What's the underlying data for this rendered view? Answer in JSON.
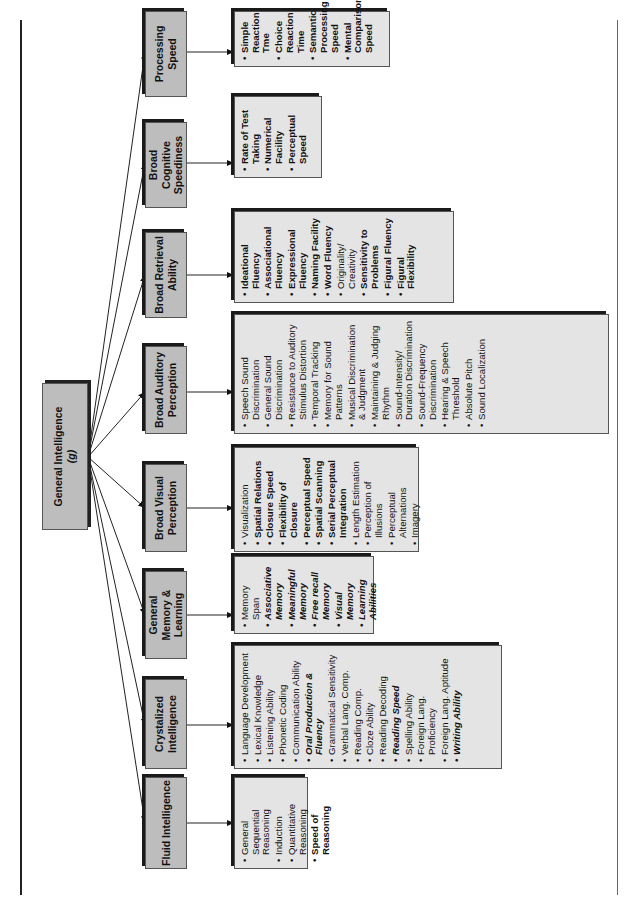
{
  "diagram": {
    "orientation": "rotated 90 degrees counter-clockwise",
    "root": {
      "label_line1": "General Intelligence",
      "label_line2": "(g)"
    },
    "categories": [
      {
        "label": "Fluid Intelligence",
        "abilities": [
          {
            "text": "General Sequential Reasoning",
            "style": "normal"
          },
          {
            "text": "Induction",
            "style": "normal"
          },
          {
            "text": "Quantitative Reasoning",
            "style": "normal"
          },
          {
            "text": "Speed of Reasoning",
            "style": "bold"
          }
        ]
      },
      {
        "label": "Crystalized Intelligence",
        "abilities": [
          {
            "text": "Language Development",
            "style": "normal"
          },
          {
            "text": "Lexical Knowledge",
            "style": "normal"
          },
          {
            "text": "Listening Ability",
            "style": "normal"
          },
          {
            "text": "Phonetic Coding",
            "style": "normal"
          },
          {
            "text": "Communication Ability",
            "style": "normal"
          },
          {
            "text": "Oral Production & Fluency",
            "style": "italic"
          },
          {
            "text": "Grammatical Sensitivity",
            "style": "normal"
          },
          {
            "text": "Verbal Lang. Comp.",
            "style": "normal"
          },
          {
            "text": "Reading Comp.",
            "style": "normal"
          },
          {
            "text": "Cloze Ability",
            "style": "normal"
          },
          {
            "text": "Reading Decoding",
            "style": "normal"
          },
          {
            "text": "Reading Speed",
            "style": "italic"
          },
          {
            "text": "Spelling Ability",
            "style": "normal"
          },
          {
            "text": "Foreign Lang. Proficiency",
            "style": "normal"
          },
          {
            "text": "Foreign Lang. Aptitude",
            "style": "normal"
          },
          {
            "text": "Writing Ability",
            "style": "italic"
          }
        ]
      },
      {
        "label": "General Memory & Learning",
        "abilities": [
          {
            "text": "Memory Span",
            "style": "normal"
          },
          {
            "text": "Associative Memory",
            "style": "bolditalic"
          },
          {
            "text": "Meaningful Memory",
            "style": "bolditalic"
          },
          {
            "text": "Free recall Memory",
            "style": "bolditalic"
          },
          {
            "text": "Visual Memory",
            "style": "bolditalic"
          },
          {
            "text": "Learning Abilities",
            "style": "bolditalic"
          }
        ]
      },
      {
        "label": "Broad Visual Perception",
        "abilities": [
          {
            "text": "Visualization",
            "style": "normal"
          },
          {
            "text": "Spatial Relations",
            "style": "bold"
          },
          {
            "text": "Closure Speed",
            "style": "bold"
          },
          {
            "text": "Flexibility of Closure",
            "style": "bold"
          },
          {
            "text": "Perceptual Speed",
            "style": "bold"
          },
          {
            "text": "Spatial Scanning",
            "style": "bold"
          },
          {
            "text": "Serial Perceptual Integration",
            "style": "bold"
          },
          {
            "text": "Length Estimation",
            "style": "normal"
          },
          {
            "text": "Perception of Illusions",
            "style": "normal"
          },
          {
            "text": "Perceptual Alternations",
            "style": "normal"
          },
          {
            "text": "Imagery",
            "style": "normal"
          }
        ]
      },
      {
        "label": "Broad Auditory Perception",
        "abilities": [
          {
            "text": "Speech Sound Discrimination",
            "style": "normal"
          },
          {
            "text": "General Sound Discrimination",
            "style": "normal"
          },
          {
            "text": "Resistance to Auditory Stimulus Distortion",
            "style": "normal"
          },
          {
            "text": "Temporal Tracking",
            "style": "normal"
          },
          {
            "text": "Memory for Sound Patterns",
            "style": "normal"
          },
          {
            "text": "Musical Discrimination & Judgment",
            "style": "normal"
          },
          {
            "text": "Maintaining & Judging Rhythm",
            "style": "normal"
          },
          {
            "text": "Sound-Intensity/ Duration Discrimination",
            "style": "normal"
          },
          {
            "text": "Sound-Frequency Discrimination",
            "style": "normal"
          },
          {
            "text": "Hearing & Speech Threshold",
            "style": "normal"
          },
          {
            "text": "Absolute Pitch",
            "style": "normal"
          },
          {
            "text": "Sound Localization",
            "style": "normal"
          }
        ]
      },
      {
        "label": "Broad Retrieval Ability",
        "abilities": [
          {
            "text": "Ideational Fluency",
            "style": "bold"
          },
          {
            "text": "Associational Fluency",
            "style": "bold"
          },
          {
            "text": "Expressional Fluency",
            "style": "bold"
          },
          {
            "text": "Naming Facility",
            "style": "bold"
          },
          {
            "text": "Word Fluency",
            "style": "bold"
          },
          {
            "text": "Originality/ Creativity",
            "style": "normal"
          },
          {
            "text": "Sensitivity to Problems",
            "style": "bold"
          },
          {
            "text": "Figural Fluency",
            "style": "bold"
          },
          {
            "text": "Figural Flexibility",
            "style": "bold"
          }
        ]
      },
      {
        "label": "Broad Cognitive Speediness",
        "abilities": [
          {
            "text": "Rate of Test Taking",
            "style": "bold"
          },
          {
            "text": "Numerical Facility",
            "style": "bold"
          },
          {
            "text": "Perceptual Speed",
            "style": "bold"
          }
        ]
      },
      {
        "label": "Processing Speed",
        "abilities": [
          {
            "text": "Simple Reaction Tme",
            "style": "bold"
          },
          {
            "text": "Choice Reaction Time",
            "style": "bold"
          },
          {
            "text": "Semantic Processing Speed",
            "style": "bold"
          },
          {
            "text": "Mental Comparison Speed",
            "style": "bold"
          }
        ]
      }
    ]
  }
}
